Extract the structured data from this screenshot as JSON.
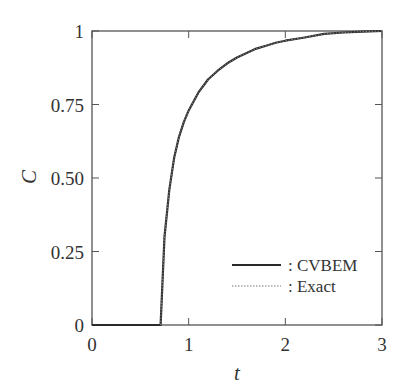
{
  "chart_data": {
    "type": "line",
    "title": "",
    "xlabel": "t",
    "ylabel": "C",
    "xlim": [
      0,
      3
    ],
    "ylim": [
      0,
      1
    ],
    "xticks": [
      "0",
      "1",
      "2",
      "3"
    ],
    "yticks": [
      "0",
      "0.25",
      "0.50",
      "0.75",
      "1"
    ],
    "grid": false,
    "legend_position": "lower right",
    "series": [
      {
        "name": ": CVBEM",
        "style": "solid",
        "x": [
          0.71,
          0.71,
          0.75,
          0.8,
          0.85,
          0.9,
          0.95,
          1.0,
          1.1,
          1.2,
          1.3,
          1.4,
          1.5,
          1.6,
          1.7,
          1.8,
          1.9,
          2.0,
          2.2,
          2.4,
          2.6,
          2.8,
          3.0
        ],
        "y": [
          0.0,
          0.0,
          0.3,
          0.46,
          0.57,
          0.64,
          0.69,
          0.73,
          0.79,
          0.835,
          0.865,
          0.89,
          0.91,
          0.925,
          0.94,
          0.95,
          0.96,
          0.967,
          0.978,
          0.99,
          0.995,
          0.998,
          1.0
        ]
      },
      {
        "name": ": Exact",
        "style": "dotted",
        "x": [
          0.71,
          0.71,
          0.75,
          0.8,
          0.85,
          0.9,
          0.95,
          1.0,
          1.1,
          1.2,
          1.3,
          1.4,
          1.5,
          1.6,
          1.7,
          1.8,
          1.9,
          2.0,
          2.2,
          2.4,
          2.6,
          2.8,
          3.0
        ],
        "y": [
          0.0,
          0.0,
          0.3,
          0.46,
          0.57,
          0.64,
          0.69,
          0.73,
          0.79,
          0.835,
          0.865,
          0.89,
          0.91,
          0.925,
          0.94,
          0.95,
          0.96,
          0.967,
          0.978,
          0.99,
          0.995,
          0.998,
          1.0
        ]
      }
    ]
  },
  "legend": {
    "items": [
      {
        "label": ": CVBEM",
        "style": "solid"
      },
      {
        "label": ": Exact",
        "style": "dotted"
      }
    ]
  },
  "colors": {
    "line": "#2a2a2a",
    "axis": "#555555"
  }
}
